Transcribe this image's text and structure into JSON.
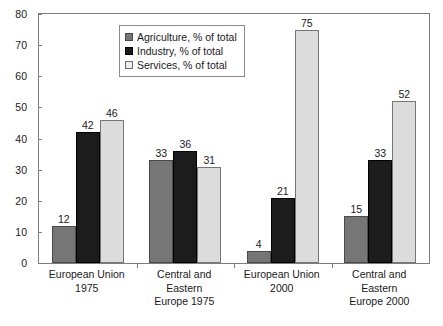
{
  "chart_data": {
    "type": "bar",
    "title": "",
    "subtitle": "",
    "xlabel": "",
    "ylabel": "",
    "ylim": [
      0,
      80
    ],
    "ytick_step": 10,
    "yticks": [
      "0",
      "10",
      "20",
      "30",
      "40",
      "50",
      "60",
      "70",
      "80"
    ],
    "grid": false,
    "legend_position": "inside-top-center",
    "categories": [
      "European Union\n1975",
      "Central and\nEastern\nEurope 1975",
      "European Union\n2000",
      "Central and\nEastern\nEurope 2000"
    ],
    "category_lines": [
      [
        "European Union",
        "1975"
      ],
      [
        "Central and",
        "Eastern",
        "Europe 1975"
      ],
      [
        "European Union",
        "2000"
      ],
      [
        "Central and",
        "Eastern",
        "Europe 2000"
      ]
    ],
    "series": [
      {
        "name": "Agriculture, % of total",
        "color": "#767676",
        "values": [
          12,
          33,
          4,
          15
        ],
        "labels": [
          "12",
          "33",
          "4",
          "15"
        ]
      },
      {
        "name": "Industry, % of total",
        "color": "#1c1c1c",
        "values": [
          42,
          36,
          21,
          33
        ],
        "labels": [
          "42",
          "36",
          "21",
          "33"
        ]
      },
      {
        "name": "Services, % of total",
        "color": "#dcdcdc",
        "values": [
          46,
          31,
          75,
          52
        ],
        "labels": [
          "46",
          "31",
          "75",
          "52"
        ]
      }
    ]
  },
  "legend": {
    "items": [
      {
        "label": "Agriculture, % of total",
        "swatch": "agriculture-swatch"
      },
      {
        "label": "Industry, % of total",
        "swatch": "industry-swatch"
      },
      {
        "label": "Services, % of total",
        "swatch": "services-swatch"
      }
    ]
  },
  "colors": {
    "agriculture": "#767676",
    "industry": "#1c1c1c",
    "services": "#dcdcdc",
    "frame": "#7d7d7d",
    "text": "#1a1a1a",
    "background": "#ffffff"
  }
}
